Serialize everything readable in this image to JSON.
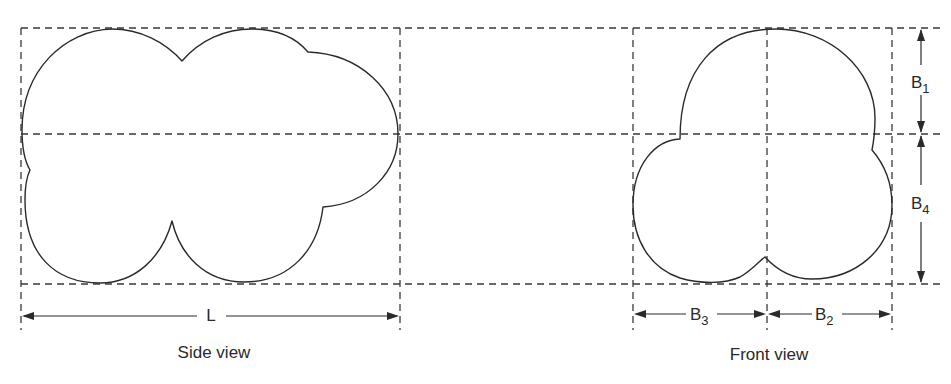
{
  "figure": {
    "type": "technical-drawing",
    "views": [
      {
        "id": "side",
        "caption": "Side view",
        "dimension_label": "L"
      },
      {
        "id": "front",
        "caption": "Front view",
        "dimension_labels": [
          "B3",
          "B2",
          "B1",
          "B4"
        ]
      }
    ]
  },
  "side_view": {
    "caption": "Side view",
    "length_label": "L"
  },
  "front_view": {
    "caption": "Front view",
    "b1": {
      "main": "B",
      "sub": "1"
    },
    "b2": {
      "main": "B",
      "sub": "2"
    },
    "b3": {
      "main": "B",
      "sub": "3"
    },
    "b4": {
      "main": "B",
      "sub": "4"
    }
  },
  "colors": {
    "line": "#2a2a2a",
    "background": "#ffffff"
  }
}
